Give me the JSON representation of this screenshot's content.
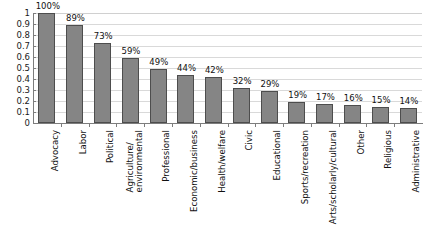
{
  "chart_data": {
    "type": "bar",
    "title": "",
    "xlabel": "",
    "ylabel": "",
    "ylim": [
      0,
      1
    ],
    "grid": true,
    "legend": false,
    "y_ticks": [
      "0",
      "0.1",
      "0.2",
      "0.3",
      "0.4",
      "0.5",
      "0.6",
      "0.7",
      "0.8",
      "0.9",
      "1"
    ],
    "y_tick_values": [
      0,
      0.1,
      0.2,
      0.3,
      0.4,
      0.5,
      0.6,
      0.7,
      0.8,
      0.9,
      1
    ],
    "categories": [
      "Advocacy",
      "Labor",
      "Political",
      "Agriculture/environmental",
      "Professional",
      "Economic/business",
      "Health/welfare",
      "Civic",
      "Educational",
      "Sports/recreation",
      "Arts/scholarly/cultural",
      "Other",
      "Religious",
      "Administrative"
    ],
    "category_lines": [
      [
        "Advocacy"
      ],
      [
        "Labor"
      ],
      [
        "Political"
      ],
      [
        "Agriculture/",
        "environmental"
      ],
      [
        "Professional"
      ],
      [
        "Economic/business"
      ],
      [
        "Health/welfare"
      ],
      [
        "Civic"
      ],
      [
        "Educational"
      ],
      [
        "Sports/recreation"
      ],
      [
        "Arts/scholarly/cultural"
      ],
      [
        "Other"
      ],
      [
        "Religious"
      ],
      [
        "Administrative"
      ]
    ],
    "values": [
      1.0,
      0.89,
      0.73,
      0.59,
      0.49,
      0.44,
      0.42,
      0.32,
      0.29,
      0.19,
      0.17,
      0.16,
      0.15,
      0.14
    ],
    "data_labels": [
      "100%",
      "89%",
      "73%",
      "59%",
      "49%",
      "44%",
      "42%",
      "32%",
      "29%",
      "19%",
      "17%",
      "16%",
      "15%",
      "14%"
    ]
  },
  "colors": {
    "bar_fill": "#858585",
    "bar_border": "#4d4d4d",
    "gridline": "#d9d9d9",
    "axis": "#7d7d7d",
    "text": "#111111",
    "background": "#ffffff"
  }
}
